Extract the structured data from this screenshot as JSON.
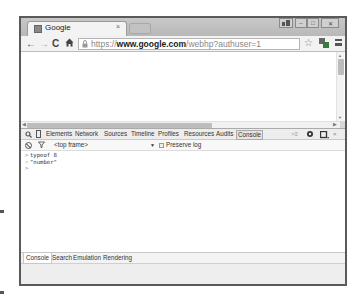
{
  "browser": {
    "tab": {
      "title": "Google",
      "favicon": "google-favicon",
      "close": "×"
    },
    "window_controls": {
      "user": "user-icon",
      "minimize": "–",
      "maximize": "□",
      "close": "✕"
    },
    "nav": {
      "back": "←",
      "forward": "→",
      "reload": "C",
      "home": "home-icon"
    },
    "address": {
      "scheme": "https://",
      "host": "www.google.com",
      "path": "/webhp?authuser=1"
    },
    "toolbar_icons": {
      "star": "☆",
      "extension": "extension-icon",
      "menu": "menu-icon"
    }
  },
  "devtools": {
    "tabs": [
      {
        "label": "Elements"
      },
      {
        "label": "Network"
      },
      {
        "label": "Sources"
      },
      {
        "label": "Timeline"
      },
      {
        "label": "Profiles"
      },
      {
        "label": "Resources"
      },
      {
        "label": "Audits"
      },
      {
        "label": "Console",
        "active": true
      }
    ],
    "icons": {
      "search": "search-icon",
      "device": "device-mode-icon",
      "drawer": "show-drawer-icon",
      "settings": "gear-icon",
      "dock": "dock-icon",
      "close": "close-icon"
    },
    "console_bar": {
      "frame": "<top frame>",
      "frame_arrow": "▼",
      "preserve_log": "Preserve log"
    },
    "console_lines": [
      {
        "kind": "input",
        "prefix": ">",
        "text": "typeof 8"
      },
      {
        "kind": "output",
        "prefix": "<",
        "text": "\"number\""
      },
      {
        "kind": "prompt",
        "prefix": ">",
        "text": ""
      }
    ],
    "drawer_tabs": [
      {
        "label": "Console",
        "active": true
      },
      {
        "label": "Search"
      },
      {
        "label": "Emulation"
      },
      {
        "label": "Rendering"
      }
    ]
  },
  "colors": {
    "window_border": "#5a5a5a",
    "tabstrip": "#c0c0c0",
    "toolbar": "#f2f2f2",
    "devtools_tabbar": "#ededed"
  }
}
